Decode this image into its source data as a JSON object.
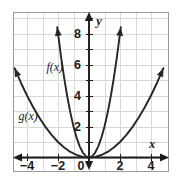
{
  "figure": {
    "background_color": "#ffffff",
    "frame_color": "#9a9a9a",
    "grid_color": "#d8d8d8",
    "axis_color": "#1b1b1b",
    "curve_color": "#262626"
  },
  "chart_data": {
    "type": "line",
    "title": "",
    "subtitle": "",
    "xlabel": "x",
    "ylabel": "y",
    "xlim": [
      -5,
      5
    ],
    "ylim": [
      -1,
      9
    ],
    "grid": true,
    "grid_step_x": 1,
    "grid_step_y": 1,
    "legend_position": "inline-curve-labels",
    "x_ticks": [
      -4,
      -2,
      2,
      4
    ],
    "x_tick_labels": [
      "−4",
      "−2",
      "2",
      "4"
    ],
    "y_ticks": [
      2,
      4,
      6,
      8
    ],
    "y_tick_labels": [
      "2",
      "4",
      "6",
      "8"
    ],
    "origin_label": "0",
    "annotations": [
      {
        "text": "f(x)",
        "x": -2.75,
        "y": 5.55
      },
      {
        "text": "g(x)",
        "x": -4.55,
        "y": 2.45
      }
    ],
    "series": [
      {
        "name": "f(x)",
        "label": "f(x)",
        "equation": "y = 2x^2",
        "coefficient": 2,
        "color": "#262626",
        "arrows": "both",
        "x": [
          -2.05,
          -1.8,
          -1.6,
          -1.4,
          -1.2,
          -1.0,
          -0.8,
          -0.6,
          -0.4,
          -0.2,
          0,
          0.2,
          0.4,
          0.6,
          0.8,
          1.0,
          1.2,
          1.4,
          1.6,
          1.8,
          2.05
        ],
        "y": [
          8.4,
          6.48,
          5.12,
          3.92,
          2.88,
          2.0,
          1.28,
          0.72,
          0.32,
          0.08,
          0,
          0.08,
          0.32,
          0.72,
          1.28,
          2.0,
          2.88,
          3.92,
          5.12,
          6.48,
          8.4
        ]
      },
      {
        "name": "g(x)",
        "label": "g(x)",
        "equation": "y = 0.25x^2",
        "coefficient": 0.25,
        "color": "#262626",
        "arrows": "both",
        "x": [
          -4.8,
          -4.4,
          -4.0,
          -3.6,
          -3.2,
          -2.8,
          -2.4,
          -2.0,
          -1.6,
          -1.2,
          -0.8,
          -0.4,
          0,
          0.4,
          0.8,
          1.2,
          1.6,
          2.0,
          2.4,
          2.8,
          3.2,
          3.6,
          4.0,
          4.4,
          4.8
        ],
        "y": [
          5.76,
          4.84,
          4.0,
          3.24,
          2.56,
          1.96,
          1.44,
          1.0,
          0.64,
          0.36,
          0.16,
          0.04,
          0,
          0.04,
          0.16,
          0.36,
          0.64,
          1.0,
          1.44,
          1.96,
          2.56,
          3.24,
          4.0,
          4.84,
          5.76
        ]
      }
    ]
  }
}
